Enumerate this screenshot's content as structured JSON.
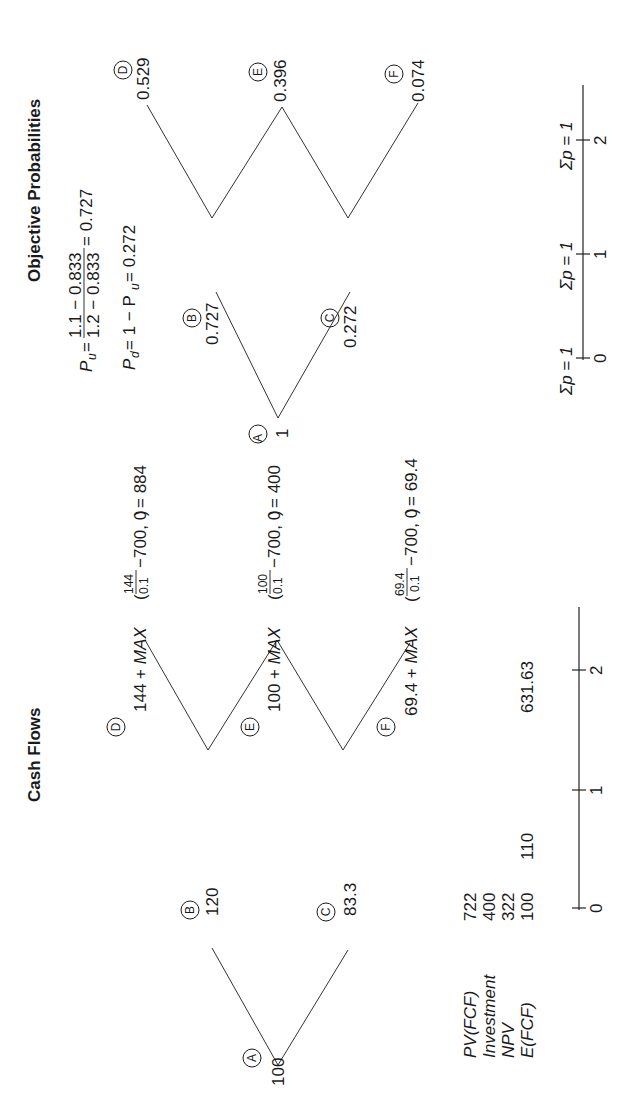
{
  "probabilities": {
    "title": "Objective Probabilities",
    "pu_formula": {
      "lhs": "P",
      "lhs_sub": "u",
      "numerator": "1.1 − 0.833",
      "denominator": "1.2 − 0.833",
      "result": "= 0.727"
    },
    "pd_formula": {
      "lhs": "P",
      "lhs_sub": "d",
      "rhs_prefix": "= 1 − P",
      "rhs_sub": "u",
      "result": "= 0.272"
    },
    "nodes": {
      "A": {
        "label": "A",
        "value": "1"
      },
      "B": {
        "label": "B",
        "value": "0.727"
      },
      "C": {
        "label": "C",
        "value": "0.272"
      },
      "D": {
        "label": "D",
        "value": "0.529"
      },
      "E": {
        "label": "E",
        "value": "0.396"
      },
      "F": {
        "label": "F",
        "value": "0.074"
      }
    },
    "axis": {
      "ticks": [
        "0",
        "1",
        "2"
      ],
      "sums": [
        "Σp = 1",
        "Σp = 1",
        "Σp = 1"
      ]
    }
  },
  "cash_flows": {
    "title": "Cash Flows",
    "nodes": {
      "A": {
        "label": "A",
        "value": "100"
      },
      "B": {
        "label": "B",
        "value": "120"
      },
      "C": {
        "label": "C",
        "value": "83.3"
      },
      "D": {
        "label": "D",
        "prefix": "144 + ",
        "max": "MAX",
        "num": "144",
        "den": "0.1",
        "tail": "−700, 0",
        "result": "= 884"
      },
      "E": {
        "label": "E",
        "prefix": "100 + ",
        "max": "MAX",
        "num": "100",
        "den": "0.1",
        "tail": "−700, 0",
        "result": "= 400"
      },
      "F": {
        "label": "F",
        "prefix": "69.4 + ",
        "max": "MAX",
        "num": "69.4",
        "den": "0.1",
        "tail": "−700, 0",
        "result": "= 69.4"
      }
    },
    "summary": [
      {
        "label": "PV(FCF)",
        "value": "722"
      },
      {
        "label": "Investment",
        "value": "400"
      },
      {
        "label": "NPV",
        "value": "322"
      },
      {
        "label": "E(FCF)",
        "value": "100"
      }
    ],
    "period_values": {
      "t1": "110",
      "t2": "631.63"
    },
    "axis": {
      "ticks": [
        "0",
        "1",
        "2"
      ]
    }
  }
}
